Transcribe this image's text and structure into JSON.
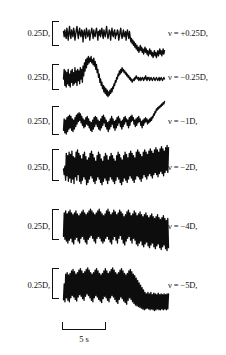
{
  "figure": {
    "background_color": "#ffffff",
    "trace_color": "#0d0d0d",
    "text_color": "#111111"
  },
  "y_scale": {
    "label": "0.25D,",
    "value": 0.25,
    "unit": "D"
  },
  "x_scale": {
    "label": "5 s",
    "value": 5,
    "unit": "s"
  },
  "rows": [
    {
      "y_label": "0.25D,",
      "v_label": "ν = +0.25D,"
    },
    {
      "y_label": "0.25D,",
      "v_label": "ν = −0.25D,"
    },
    {
      "y_label": "0.25D,",
      "v_label": "ν = −1D,"
    },
    {
      "y_label": "0.25D,",
      "v_label": "ν = −2D,"
    },
    {
      "y_label": "0.25D,",
      "v_label": "ν = −4D,"
    },
    {
      "y_label": "0.25D,",
      "v_label": "ν = −5D,"
    }
  ],
  "chart_data": {
    "type": "line",
    "title": "",
    "xlabel": "time",
    "ylabel": "accommodation",
    "x_scale_bar": {
      "length_label": "5 s",
      "length_value": 5,
      "unit": "s"
    },
    "y_scale_bar": {
      "length_label": "0.25D,",
      "length_value": 0.25,
      "unit": "D"
    },
    "grid": false,
    "legend_position": "right",
    "series": [
      {
        "name": "ν = +0.25D,",
        "vergence": 0.25,
        "amplitude_rel": 0.12,
        "n_points": 150,
        "values": [
          0.02,
          -0.01,
          0.03,
          0.0,
          -0.02,
          0.04,
          0.01,
          -0.03,
          0.02,
          0.05,
          0.0,
          -0.02,
          0.03,
          0.01,
          -0.01,
          0.04,
          0.02,
          -0.03,
          0.0,
          0.03,
          0.05,
          0.01,
          -0.02,
          0.02,
          0.04,
          0.0,
          -0.01,
          0.03,
          0.02,
          -0.04,
          0.01,
          0.03,
          0.0,
          -0.02,
          0.04,
          0.02,
          -0.01,
          0.01,
          0.03,
          -0.03,
          0.0,
          0.02,
          0.04,
          0.01,
          -0.02,
          0.03,
          0.0,
          -0.01,
          0.02,
          0.04,
          0.01,
          -0.03,
          0.02,
          0.0,
          0.03,
          -0.01,
          0.02,
          0.04,
          0.0,
          -0.02,
          0.03,
          0.01,
          -0.01,
          0.02,
          0.05,
          0.01,
          -0.02,
          0.0,
          0.03,
          0.02,
          -0.03,
          0.01,
          0.04,
          0.0,
          -0.01,
          0.02,
          0.03,
          -0.02,
          0.01,
          0.0,
          0.03,
          0.02,
          -0.03,
          -0.01,
          0.02,
          0.04,
          0.0,
          -0.02,
          0.01,
          0.03,
          -0.01,
          0.0,
          0.02,
          -0.03,
          0.01,
          0.03,
          0.0,
          -0.02,
          0.02,
          -0.01,
          -0.04,
          -0.02,
          -0.05,
          -0.03,
          -0.06,
          -0.04,
          -0.07,
          -0.05,
          -0.08,
          -0.06,
          -0.09,
          -0.07,
          -0.1,
          -0.08,
          -0.06,
          -0.09,
          -0.07,
          -0.1,
          -0.08,
          -0.11,
          -0.09,
          -0.07,
          -0.1,
          -0.08,
          -0.11,
          -0.09,
          -0.12,
          -0.1,
          -0.08,
          -0.11,
          -0.09,
          -0.12,
          -0.1,
          -0.13,
          -0.11,
          -0.09,
          -0.12,
          -0.1,
          -0.13,
          -0.11,
          -0.09,
          -0.12,
          -0.1,
          -0.08,
          -0.11,
          -0.09,
          -0.12,
          -0.1,
          -0.08,
          -0.11,
          -0.09
        ]
      },
      {
        "name": "ν = −0.25D,",
        "vergence": -0.25,
        "amplitude_rel": 0.25,
        "n_points": 150,
        "values": [
          0.0,
          0.06,
          -0.04,
          0.05,
          -0.05,
          0.04,
          -0.03,
          0.06,
          -0.04,
          0.03,
          -0.05,
          0.05,
          -0.02,
          0.06,
          -0.04,
          0.04,
          -0.03,
          0.07,
          -0.02,
          0.05,
          -0.04,
          0.06,
          -0.01,
          0.05,
          -0.03,
          0.07,
          0.0,
          0.06,
          -0.02,
          0.08,
          0.02,
          0.1,
          0.05,
          0.12,
          0.07,
          0.13,
          0.09,
          0.14,
          0.1,
          0.13,
          0.11,
          0.14,
          0.1,
          0.12,
          0.09,
          0.13,
          0.08,
          0.11,
          0.06,
          0.09,
          0.04,
          0.06,
          0.01,
          0.03,
          -0.02,
          0.0,
          -0.04,
          -0.02,
          -0.06,
          -0.04,
          -0.08,
          -0.05,
          -0.09,
          -0.06,
          -0.1,
          -0.07,
          -0.11,
          -0.08,
          -0.1,
          -0.07,
          -0.09,
          -0.06,
          -0.08,
          -0.05,
          -0.06,
          -0.03,
          -0.04,
          -0.01,
          -0.02,
          0.01,
          0.0,
          0.03,
          0.02,
          0.05,
          0.03,
          0.06,
          0.04,
          0.07,
          0.05,
          0.06,
          0.04,
          0.05,
          0.03,
          0.04,
          0.02,
          0.03,
          0.01,
          0.02,
          0.0,
          0.01,
          -0.01,
          0.0,
          -0.02,
          -0.01,
          0.0,
          -0.01,
          0.01,
          0.0,
          0.02,
          0.01,
          0.0,
          0.01,
          -0.01,
          0.0,
          0.01,
          -0.01,
          0.0,
          0.01,
          0.0,
          -0.01,
          0.01,
          0.0,
          0.02,
          0.0,
          -0.01,
          0.01,
          0.0,
          0.01,
          -0.01,
          0.0,
          0.01,
          0.0,
          -0.01,
          0.0,
          0.01,
          0.0,
          -0.01,
          0.0,
          0.01,
          0.0,
          -0.01,
          0.0,
          0.01,
          -0.01,
          0.0,
          0.01,
          0.0,
          -0.01,
          0.0,
          0.01,
          0.0
        ]
      },
      {
        "name": "ν = −1D,",
        "vergence": -1,
        "amplitude_rel": 0.45,
        "n_points": 150,
        "values": [
          -0.1,
          0.08,
          -0.14,
          0.06,
          -0.16,
          0.1,
          -0.12,
          0.12,
          -0.08,
          0.14,
          -0.06,
          0.12,
          -0.1,
          0.08,
          -0.12,
          0.06,
          -0.08,
          0.1,
          -0.04,
          0.14,
          0.0,
          0.16,
          0.04,
          0.18,
          0.06,
          0.16,
          0.02,
          0.12,
          -0.02,
          0.08,
          -0.06,
          0.06,
          -0.04,
          0.1,
          0.0,
          0.12,
          -0.02,
          0.08,
          -0.06,
          0.04,
          -0.1,
          0.02,
          -0.12,
          0.06,
          -0.08,
          0.1,
          -0.04,
          0.12,
          0.0,
          0.1,
          -0.04,
          0.06,
          -0.08,
          0.04,
          -0.1,
          0.08,
          -0.06,
          0.12,
          -0.02,
          0.14,
          0.02,
          0.1,
          -0.04,
          0.06,
          -0.08,
          0.02,
          -0.12,
          0.04,
          -0.08,
          0.08,
          -0.04,
          0.12,
          0.0,
          0.08,
          -0.06,
          0.04,
          -0.1,
          0.06,
          -0.06,
          0.1,
          -0.02,
          0.12,
          0.02,
          0.08,
          -0.04,
          0.04,
          -0.08,
          0.06,
          -0.04,
          0.1,
          0.0,
          0.12,
          0.04,
          0.08,
          -0.02,
          0.06,
          -0.06,
          0.1,
          -0.02,
          0.12,
          0.04,
          0.14,
          0.06,
          0.1,
          0.0,
          0.06,
          -0.04,
          0.08,
          -0.02,
          0.1,
          0.02,
          0.12,
          0.04,
          0.08,
          -0.02,
          0.04,
          -0.06,
          0.06,
          -0.02,
          0.08,
          0.02,
          0.1,
          0.04,
          0.08,
          0.0,
          0.06,
          0.02,
          0.08,
          0.04,
          0.1,
          0.06,
          0.12,
          0.1,
          0.16,
          0.14,
          0.2,
          0.18,
          0.24,
          0.22,
          0.26,
          0.24,
          0.28,
          0.26,
          0.3,
          0.28,
          0.32,
          0.3,
          0.34,
          0.32,
          0.36
        ]
      },
      {
        "name": "ν = −2D,",
        "vergence": -2,
        "amplitude_rel": 0.75,
        "n_points": 150,
        "values": [
          0.0,
          -0.1,
          0.05,
          -0.2,
          0.28,
          -0.12,
          0.24,
          -0.22,
          0.3,
          -0.16,
          0.26,
          -0.24,
          0.32,
          -0.18,
          0.22,
          -0.26,
          0.2,
          -0.14,
          0.3,
          -0.2,
          0.34,
          -0.1,
          0.28,
          -0.22,
          0.24,
          -0.26,
          0.18,
          -0.2,
          0.26,
          -0.14,
          0.3,
          -0.18,
          0.22,
          -0.28,
          0.16,
          -0.24,
          0.2,
          -0.18,
          0.28,
          -0.12,
          0.32,
          -0.16,
          0.26,
          -0.22,
          0.2,
          -0.26,
          0.14,
          -0.2,
          0.24,
          -0.14,
          0.3,
          -0.18,
          0.26,
          -0.24,
          0.18,
          -0.28,
          0.14,
          -0.22,
          0.22,
          -0.16,
          0.28,
          -0.2,
          0.24,
          -0.26,
          0.16,
          -0.2,
          0.22,
          -0.14,
          0.28,
          -0.18,
          0.24,
          -0.22,
          0.18,
          -0.26,
          0.14,
          -0.2,
          0.24,
          -0.14,
          0.3,
          -0.18,
          0.26,
          -0.24,
          0.2,
          -0.28,
          0.16,
          -0.22,
          0.24,
          -0.16,
          0.3,
          -0.2,
          0.26,
          -0.24,
          0.2,
          -0.18,
          0.28,
          -0.12,
          0.32,
          -0.16,
          0.28,
          -0.2,
          0.24,
          -0.24,
          0.2,
          -0.18,
          0.3,
          -0.12,
          0.34,
          -0.14,
          0.3,
          -0.18,
          0.26,
          -0.22,
          0.22,
          -0.16,
          0.3,
          -0.1,
          0.34,
          -0.14,
          0.3,
          -0.18,
          0.26,
          -0.12,
          0.32,
          -0.08,
          0.36,
          -0.12,
          0.32,
          -0.16,
          0.28,
          -0.1,
          0.34,
          -0.06,
          0.38,
          -0.1,
          0.34,
          -0.14,
          0.3,
          -0.08,
          0.36,
          -0.04,
          0.4,
          -0.08,
          0.36,
          -0.12,
          0.32,
          -0.06,
          0.38,
          -0.02,
          0.42,
          -0.06,
          0.38
        ]
      },
      {
        "name": "ν = −4D,",
        "vergence": -4,
        "amplitude_rel": 0.85,
        "n_points": 150,
        "values": [
          -0.2,
          0.3,
          -0.26,
          0.34,
          -0.3,
          0.28,
          -0.34,
          0.32,
          -0.28,
          0.36,
          -0.24,
          0.3,
          -0.32,
          0.26,
          -0.36,
          0.3,
          -0.26,
          0.34,
          -0.22,
          0.28,
          -0.3,
          0.24,
          -0.34,
          0.28,
          -0.24,
          0.32,
          -0.2,
          0.36,
          -0.26,
          0.3,
          -0.32,
          0.26,
          -0.36,
          0.3,
          -0.26,
          0.34,
          -0.22,
          0.38,
          -0.18,
          0.34,
          -0.24,
          0.3,
          -0.3,
          0.26,
          -0.34,
          0.3,
          -0.24,
          0.34,
          -0.2,
          0.38,
          -0.24,
          0.32,
          -0.3,
          0.28,
          -0.34,
          0.24,
          -0.3,
          0.28,
          -0.24,
          0.34,
          -0.2,
          0.38,
          -0.26,
          0.32,
          -0.32,
          0.26,
          -0.36,
          0.3,
          -0.26,
          0.36,
          -0.2,
          0.32,
          -0.28,
          0.26,
          -0.34,
          0.3,
          -0.24,
          0.36,
          -0.18,
          0.32,
          -0.26,
          0.28,
          -0.34,
          0.22,
          -0.38,
          0.26,
          -0.3,
          0.32,
          -0.24,
          0.36,
          -0.2,
          0.3,
          -0.28,
          0.24,
          -0.34,
          0.28,
          -0.24,
          0.34,
          -0.28,
          0.3,
          -0.36,
          0.24,
          -0.4,
          0.28,
          -0.34,
          0.32,
          -0.3,
          0.26,
          -0.38,
          0.22,
          -0.42,
          0.26,
          -0.36,
          0.3,
          -0.32,
          0.24,
          -0.4,
          0.2,
          -0.44,
          0.24,
          -0.38,
          0.28,
          -0.34,
          0.22,
          -0.42,
          0.18,
          -0.46,
          0.22,
          -0.4,
          0.26,
          -0.36,
          0.2,
          -0.44,
          0.16,
          -0.48,
          0.2,
          -0.42,
          0.24,
          -0.38,
          0.18,
          -0.46,
          0.14,
          -0.5,
          0.18,
          -0.44
        ]
      },
      {
        "name": "ν = −5D,",
        "vergence": -5,
        "amplitude_rel": 0.9,
        "n_points": 150,
        "values": [
          -0.35,
          0.05,
          -0.4,
          0.3,
          -0.3,
          0.34,
          -0.36,
          0.28,
          -0.4,
          0.32,
          -0.3,
          0.38,
          -0.24,
          0.42,
          -0.28,
          0.36,
          -0.34,
          0.3,
          -0.38,
          0.34,
          -0.28,
          0.4,
          -0.22,
          0.44,
          -0.26,
          0.38,
          -0.32,
          0.32,
          -0.36,
          0.36,
          -0.26,
          0.42,
          -0.2,
          0.46,
          -0.24,
          0.4,
          -0.3,
          0.34,
          -0.36,
          0.3,
          -0.4,
          0.34,
          -0.3,
          0.4,
          -0.24,
          0.44,
          -0.28,
          0.38,
          -0.34,
          0.32,
          -0.38,
          0.28,
          -0.42,
          0.32,
          -0.32,
          0.38,
          -0.26,
          0.44,
          -0.3,
          0.38,
          -0.36,
          0.32,
          -0.4,
          0.36,
          -0.3,
          0.42,
          -0.24,
          0.46,
          -0.28,
          0.4,
          -0.34,
          0.34,
          -0.4,
          0.3,
          -0.44,
          0.34,
          -0.34,
          0.4,
          -0.28,
          0.44,
          -0.32,
          0.38,
          -0.38,
          0.32,
          -0.42,
          0.28,
          -0.46,
          0.32,
          -0.36,
          0.38,
          -0.3,
          0.42,
          -0.34,
          0.36,
          -0.4,
          0.3,
          -0.44,
          0.26,
          -0.48,
          0.2,
          -0.5,
          0.14,
          -0.52,
          0.08,
          -0.54,
          0.02,
          -0.56,
          -0.04,
          -0.58,
          -0.1,
          -0.6,
          -0.16,
          -0.58,
          -0.2,
          -0.56,
          -0.16,
          -0.58,
          -0.2,
          -0.6,
          -0.16,
          -0.58,
          -0.22,
          -0.6,
          -0.18,
          -0.62,
          -0.2,
          -0.6,
          -0.22,
          -0.58,
          -0.18,
          -0.6,
          -0.22,
          -0.6,
          -0.2,
          -0.58,
          -0.22,
          -0.6,
          -0.2,
          -0.58,
          -0.22,
          -0.6,
          -0.2,
          -0.58,
          -0.2
        ]
      }
    ]
  }
}
